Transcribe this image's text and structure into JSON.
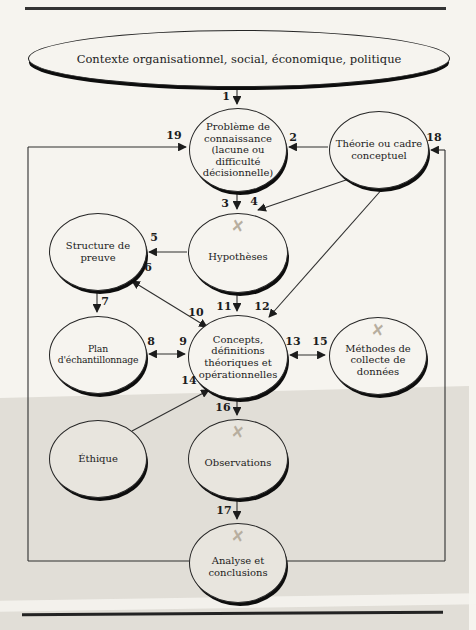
{
  "context": {
    "label": "Contexte organisationnel, social, économique, politique"
  },
  "nodes": {
    "probleme": {
      "label": "Problème de connaissance (lacune ou difficulté décisionnelle)"
    },
    "theorie": {
      "label": "Théorie ou cadre conceptuel"
    },
    "structure": {
      "label": "Structure de preuve"
    },
    "hypotheses": {
      "label": "Hypothèses"
    },
    "plan": {
      "label": "Plan d'échantillonnage"
    },
    "concepts": {
      "label": "Concepts, définitions théoriques et opérationnelles"
    },
    "methodes": {
      "label": "Méthodes de collecte de données"
    },
    "ethique": {
      "label": "Éthique"
    },
    "observations": {
      "label": "Observations"
    },
    "analyse": {
      "label": "Analyse et conclusions"
    }
  },
  "marks": {
    "pencil_x": "✕"
  },
  "arrow_labels": {
    "a1": "1",
    "a2": "2",
    "a3": "3",
    "a4": "4",
    "a5": "5",
    "a6": "6",
    "a7": "7",
    "a8": "8",
    "a9": "9",
    "a10": "10",
    "a11": "11",
    "a12": "12",
    "a13": "13",
    "a14": "14",
    "a15": "15",
    "a16": "16",
    "a17": "17",
    "a18": "18",
    "a19": "19"
  },
  "colors": {
    "paper": "#f6f4ef",
    "band": "#e1ded7",
    "ink": "#1c1c1c",
    "wire": "#2f2f2f",
    "pencil_mark": "#b7ae9f"
  }
}
